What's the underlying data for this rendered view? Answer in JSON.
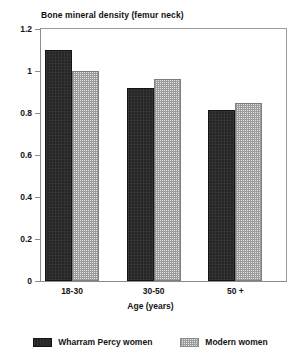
{
  "chart_data": {
    "type": "bar",
    "title": "Bone mineral density (femur neck)",
    "xlabel": "Age (years)",
    "ylabel": "",
    "categories": [
      "18-30",
      "30-50",
      "50 +"
    ],
    "series": [
      {
        "name": "Wharram Percy women",
        "values": [
          1.1,
          0.92,
          0.815
        ],
        "color": "#262626",
        "fill": "solid-dark"
      },
      {
        "name": "Modern women",
        "values": [
          1.0,
          0.96,
          0.85
        ],
        "color": "#e2e2e2",
        "fill": "light-stipple"
      }
    ],
    "ylim": [
      0,
      1.2
    ],
    "yticks": [
      0,
      0.2,
      0.4,
      0.6,
      0.8,
      1,
      1.2
    ],
    "ytick_labels": [
      "0",
      "0.2",
      "0.4",
      "0.6",
      "0.8",
      "1",
      "1.2"
    ],
    "grid": false,
    "legend_position": "bottom",
    "frame": true
  },
  "legend": {
    "entries": [
      {
        "label": "Wharram Percy women",
        "swatch": "dark-solid-swatch"
      },
      {
        "label": "Modern women",
        "swatch": "light-stipple-swatch"
      }
    ]
  }
}
